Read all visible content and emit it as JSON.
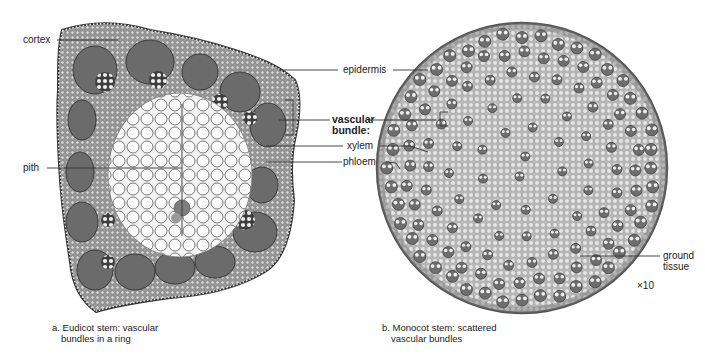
{
  "figure": {
    "panels": [
      {
        "id": "a",
        "caption_line1": "a. Eudicot stem: vascular",
        "caption_line2": "bundles in a ring",
        "labels": {
          "cortex": "cortex",
          "pith": "pith"
        }
      },
      {
        "id": "b",
        "caption_line1": "b. Monocot stem: scattered",
        "caption_line2": "vascular bundles",
        "labels": {
          "ground_tissue_line1": "ground",
          "ground_tissue_line2": "tissue",
          "magnification": "×10"
        }
      }
    ],
    "shared_labels": {
      "epidermis": "epidermis",
      "vascular_bundle_line1": "vascular",
      "vascular_bundle_line2": "bundle:",
      "xylem": "xylem",
      "phloem": "phloem"
    },
    "colors": {
      "background": "#ffffff",
      "text": "#222222",
      "leader_line": "#333333",
      "cell_wall": "#555555",
      "pith_cell": "#f2f2f2",
      "cortex_tissue": "#8a8a8a",
      "bundle_dark": "#5a5a5a",
      "ground_tissue": "#d8d8d8"
    }
  }
}
